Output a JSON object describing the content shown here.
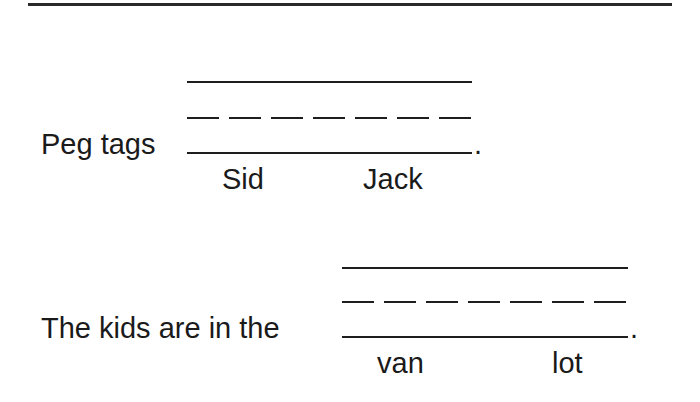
{
  "worksheet": {
    "items": [
      {
        "sentence_prefix": "Peg tags",
        "sentence_suffix": ".",
        "options": [
          "Sid",
          "Jack"
        ]
      },
      {
        "sentence_prefix": "The kids are in the",
        "sentence_suffix": ".",
        "options": [
          "van",
          "lot"
        ]
      }
    ]
  }
}
